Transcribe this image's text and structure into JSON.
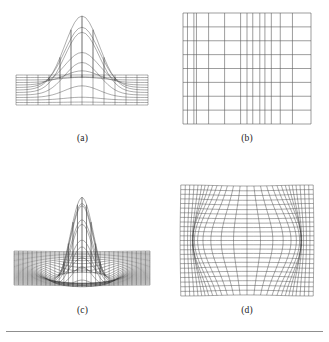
{
  "figure": {
    "background_color": "#ffffff",
    "ink_color": "#3d3d3d",
    "rule_color": "#8f8f8f",
    "panels": [
      {
        "id": "a",
        "caption": "(a)",
        "kind": "surface-wireframe",
        "description": "coarse wireframe mesh of a single tall central peak on a flat base plane",
        "mesh_columns": 12,
        "mesh_rows": 12,
        "peak_height": 1.0,
        "peak_sigma": 0.13,
        "projection": {
          "type": "oblique",
          "elevation_deg": 18,
          "azimuth_deg": 0
        }
      },
      {
        "id": "b",
        "caption": "(b)",
        "kind": "rectangular-grid",
        "description": "undeformed reference grid of straight horizontal and vertical lines",
        "columns": 12,
        "rows": 8,
        "x_lines": [
          0.0,
          0.035,
          0.085,
          0.105,
          0.2,
          0.325,
          0.45,
          0.5,
          0.545,
          0.6,
          0.64,
          0.69,
          0.76,
          0.855,
          1.0
        ],
        "y_lines": [
          0.0,
          0.125,
          0.25,
          0.375,
          0.5,
          0.625,
          0.75,
          0.875,
          1.0
        ]
      },
      {
        "id": "c",
        "caption": "(c)",
        "kind": "surface-wireframe",
        "description": "fine wireframe mesh of a sharp central spike with an annular depression around its base",
        "mesh_columns": 30,
        "mesh_rows": 30,
        "peak_height": 1.0,
        "peak_sigma": 0.085,
        "trough_depth": -0.14,
        "trough_sigma": 0.22,
        "projection": {
          "type": "oblique",
          "elevation_deg": 16,
          "azimuth_deg": 0
        }
      },
      {
        "id": "d",
        "caption": "(d)",
        "kind": "warped-grid",
        "description": "dense grid deformed by a radial displacement field pushing lines horizontally away from the centre",
        "columns": 28,
        "rows": 24,
        "warp_amplitude": 0.17,
        "warp_sigma_x": 0.17,
        "warp_sigma_y": 0.3
      }
    ]
  }
}
